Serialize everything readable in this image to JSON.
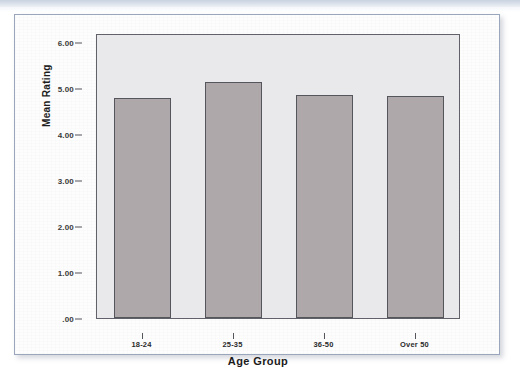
{
  "chart_data": {
    "type": "bar",
    "title": "",
    "subtitle": "",
    "xlabel": "Age Group",
    "ylabel": "Mean Rating",
    "categories": [
      "18-24",
      "25-35",
      "36-50",
      "Over 50"
    ],
    "values": [
      4.78,
      5.13,
      4.85,
      4.83
    ],
    "series": [
      {
        "name": "Mean Rating",
        "values": [
          4.78,
          5.13,
          4.85,
          4.83
        ]
      }
    ],
    "ylim": [
      0,
      6.2
    ],
    "ytick_values": [
      0,
      1,
      2,
      3,
      4,
      5,
      6
    ],
    "ytick_labels": [
      ".00",
      "1.00",
      "2.00",
      "3.00",
      "4.00",
      "5.00",
      "6.00"
    ],
    "grid": false,
    "legend": "none",
    "bar_color": "#aea8aa",
    "bar_edge_color": "#55555c",
    "plot_background": "#e9e8ea",
    "frame_color": "#61616a"
  },
  "page": {
    "band_color": "#d8dfea",
    "card_border_color": "#9aa6bb",
    "card_background": "#fdfdfd"
  }
}
